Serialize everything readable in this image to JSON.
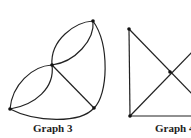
{
  "graphs": [
    {
      "label": "Graph 3",
      "vertices": [
        {
          "id": "top",
          "x": 93,
          "y": 21
        },
        {
          "id": "middle",
          "x": 52,
          "y": 65
        },
        {
          "id": "bottom-left",
          "x": 10,
          "y": 109
        },
        {
          "id": "bottom-right",
          "x": 94,
          "y": 108
        }
      ]
    },
    {
      "label": "Graph 4",
      "vertices": [
        {
          "id": "top-left",
          "x": 129,
          "y": 29
        },
        {
          "id": "center",
          "x": 170,
          "y": 72
        },
        {
          "id": "bottom-left",
          "x": 130,
          "y": 116
        }
      ]
    }
  ],
  "colors": {
    "stroke": "#222222",
    "background": "#ffffff"
  }
}
